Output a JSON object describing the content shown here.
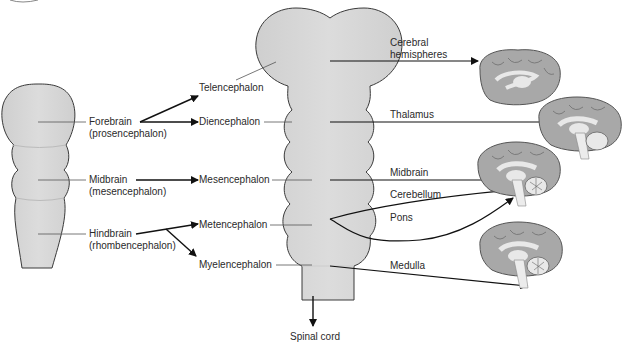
{
  "colors": {
    "embryo_fill": "#d4d4d4",
    "embryo_stroke": "#3a3a3a",
    "brain_fill": "#a8a8a8",
    "brain_dark": "#7a7a7a",
    "brain_light": "#e8e8e8",
    "arrow": "#111111",
    "leader": "#444444"
  },
  "primary_vesicles": [
    {
      "name": "Forebrain",
      "latin": "(prosencephalon)"
    },
    {
      "name": "Midbrain",
      "latin": "(mesencephalon)"
    },
    {
      "name": "Hindbrain",
      "latin": "(rhombencephalon)"
    }
  ],
  "secondary_vesicles": [
    {
      "name": "Telencephalon"
    },
    {
      "name": "Diencephalon"
    },
    {
      "name": "Mesencephalon"
    },
    {
      "name": "Metencephalon"
    },
    {
      "name": "Myelencephalon"
    }
  ],
  "spinal_cord": "Spinal cord",
  "adult_structures": [
    {
      "name": "Cerebral",
      "name2": "hemispheres"
    },
    {
      "name": "Thalamus"
    },
    {
      "name": "Midbrain"
    },
    {
      "name": "Cerebellum"
    },
    {
      "name": "Pons"
    },
    {
      "name": "Medulla"
    }
  ]
}
